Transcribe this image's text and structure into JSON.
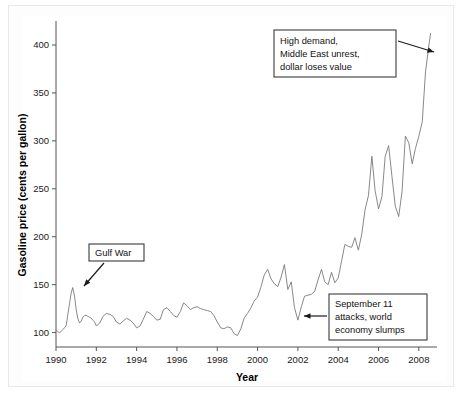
{
  "chart_data": {
    "type": "line",
    "title": "",
    "xlabel": "Year",
    "ylabel": "Gasoline price (cents per gallon)",
    "xlim": [
      1990,
      2008.9
    ],
    "ylim": [
      85,
      425
    ],
    "xticks": [
      1990,
      1992,
      1994,
      1996,
      1998,
      2000,
      2002,
      2004,
      2006,
      2008
    ],
    "xticklabels": [
      "1990",
      "1992",
      "1994",
      "1996",
      "1998",
      "2000",
      "2002",
      "2004",
      "2006",
      "2008"
    ],
    "yticks": [
      100,
      150,
      200,
      250,
      300,
      350,
      400
    ],
    "yticklabels": [
      "100",
      "150",
      "200",
      "250",
      "300",
      "350",
      "400"
    ],
    "grid": false,
    "legend": false,
    "series_name": "US retail gasoline price",
    "line_color": "#7a7a7a",
    "x": [
      1990.0,
      1990.08,
      1990.17,
      1990.25,
      1990.33,
      1990.42,
      1990.5,
      1990.58,
      1990.67,
      1990.75,
      1990.83,
      1990.92,
      1991.0,
      1991.08,
      1991.17,
      1991.25,
      1991.33,
      1991.42,
      1991.5,
      1991.58,
      1991.67,
      1991.75,
      1991.83,
      1991.92,
      1992.0,
      1992.17,
      1992.33,
      1992.5,
      1992.67,
      1992.83,
      1993.0,
      1993.17,
      1993.33,
      1993.5,
      1993.67,
      1993.83,
      1994.0,
      1994.17,
      1994.33,
      1994.5,
      1994.67,
      1994.83,
      1995.0,
      1995.17,
      1995.33,
      1995.5,
      1995.67,
      1995.83,
      1996.0,
      1996.17,
      1996.33,
      1996.5,
      1996.67,
      1996.83,
      1997.0,
      1997.17,
      1997.33,
      1997.5,
      1997.67,
      1997.83,
      1998.0,
      1998.17,
      1998.33,
      1998.5,
      1998.67,
      1998.83,
      1999.0,
      1999.17,
      1999.33,
      1999.5,
      1999.67,
      1999.83,
      2000.0,
      2000.17,
      2000.33,
      2000.5,
      2000.67,
      2000.83,
      2001.0,
      2001.17,
      2001.33,
      2001.5,
      2001.67,
      2001.83,
      2002.0,
      2002.17,
      2002.33,
      2002.5,
      2002.67,
      2002.83,
      2003.0,
      2003.17,
      2003.33,
      2003.5,
      2003.67,
      2003.83,
      2004.0,
      2004.17,
      2004.33,
      2004.5,
      2004.67,
      2004.83,
      2005.0,
      2005.17,
      2005.33,
      2005.5,
      2005.67,
      2005.83,
      2006.0,
      2006.17,
      2006.33,
      2006.5,
      2006.67,
      2006.83,
      2007.0,
      2007.17,
      2007.33,
      2007.5,
      2007.67,
      2007.83,
      2008.0,
      2008.17,
      2008.33,
      2008.5,
      2008.58
    ],
    "y": [
      103,
      101,
      100,
      101,
      103,
      105,
      107,
      118,
      130,
      141,
      147,
      138,
      124,
      115,
      110,
      112,
      116,
      118,
      118,
      117,
      116,
      115,
      113,
      111,
      107,
      110,
      117,
      120,
      119,
      117,
      111,
      109,
      112,
      115,
      113,
      110,
      105,
      107,
      114,
      122,
      120,
      117,
      113,
      114,
      124,
      126,
      122,
      118,
      116,
      122,
      131,
      128,
      124,
      126,
      127,
      125,
      124,
      123,
      122,
      118,
      111,
      105,
      104,
      106,
      105,
      99,
      97,
      104,
      115,
      120,
      126,
      133,
      137,
      148,
      160,
      166,
      156,
      151,
      148,
      158,
      171,
      145,
      153,
      126,
      113,
      127,
      138,
      139,
      140,
      143,
      155,
      166,
      153,
      150,
      163,
      152,
      157,
      175,
      192,
      190,
      189,
      199,
      186,
      203,
      228,
      243,
      284,
      248,
      229,
      242,
      284,
      295,
      262,
      232,
      221,
      248,
      305,
      298,
      276,
      292,
      305,
      320,
      372,
      400,
      412
    ],
    "annotations": [
      {
        "id": "high-demand",
        "lines": [
          "High demand,",
          "Middle East unrest,",
          "dollar loses value"
        ],
        "box": {
          "x": 274,
          "y": 30,
          "w": 122,
          "h": 47
        },
        "arrow": {
          "x1": 398,
          "y1": 41,
          "x2": 434,
          "y2": 52
        }
      },
      {
        "id": "gulf-war",
        "lines": [
          "Gulf War"
        ],
        "box": {
          "x": 89,
          "y": 244,
          "w": 55,
          "h": 17
        },
        "arrow": {
          "x1": 104,
          "y1": 263,
          "x2": 84,
          "y2": 286
        }
      },
      {
        "id": "september-11",
        "lines": [
          "September 11",
          "attacks, world",
          "economy slumps"
        ],
        "box": {
          "x": 329,
          "y": 294,
          "w": 98,
          "h": 46
        },
        "arrow": {
          "x1": 327,
          "y1": 316,
          "x2": 304,
          "y2": 316
        }
      }
    ]
  }
}
